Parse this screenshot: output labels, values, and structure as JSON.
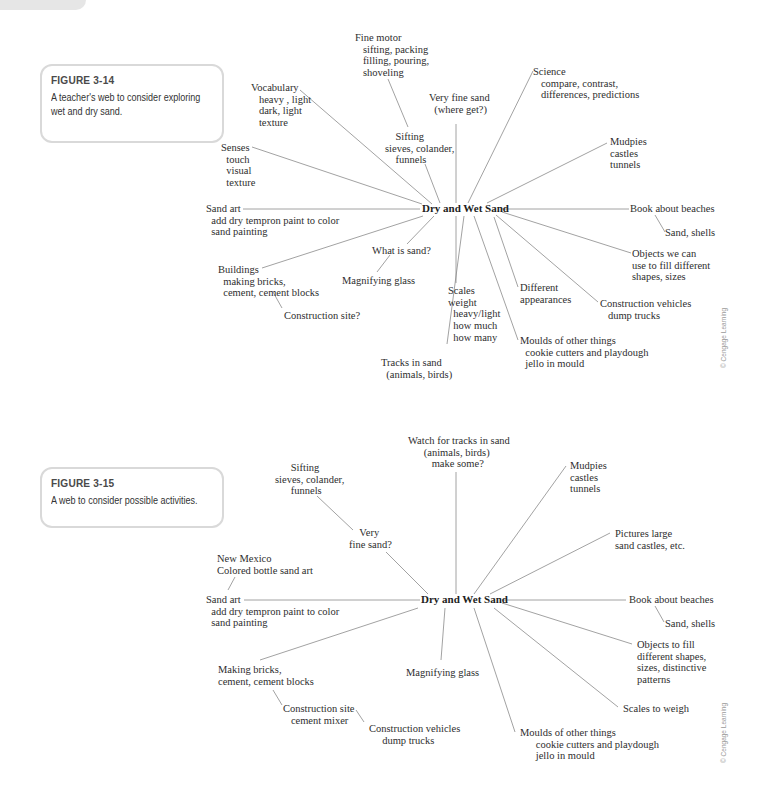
{
  "page": {
    "background": "#ffffff",
    "line_color": "#8a8a8a",
    "caption_border": "#d9d9d9"
  },
  "figures": [
    {
      "caption": {
        "title": "FIGURE 3-14",
        "lines": [
          "A teacher's web to consider exploring",
          "wet and dry sand."
        ]
      },
      "center": "Dry and Wet Sand",
      "nodes": {
        "fine_motor": "Fine motor\n   sifting, packing\n   filling, pouring,\n   shoveling",
        "vocabulary": "Vocabulary\n   heavy , light\n   dark, light\n   texture",
        "very_fine_sand": "Very fine sand\n  (where get?)",
        "science": "Science\n   compare, contrast,\n   differences, predictions",
        "sifting": "    Sifting\nsieves, colander,\n    funnels",
        "senses": "Senses\n  touch\n  visual\n  texture",
        "mudpies": "Mudpies\ncastles\ntunnels",
        "sand_art": "Sand art\n  add dry tempron paint to color\n  sand painting",
        "book": "Book about beaches",
        "sand_shells": "Sand, shells",
        "what_is_sand": "What is sand?",
        "objects": "Objects we can\nuse to fill different\nshapes, sizes",
        "buildings": "Buildings\n  making bricks,\n  cement, cement blocks",
        "magnifying": "Magnifying glass",
        "different": "Different\nappearances",
        "scales": "Scales\nweight\n  heavy/light\n  how much\n  how many",
        "construction_vehicles": "Construction vehicles\n   dump trucks",
        "construction_site": "Construction site?",
        "moulds": "Moulds of other things\n  cookie cutters and playdough\n  jello in mould",
        "tracks": "Tracks in sand\n  (animals, birds)"
      },
      "credit": "© Cengage Learning"
    },
    {
      "caption": {
        "title": "FIGURE 3-15",
        "lines": [
          "A web to consider possible activities."
        ]
      },
      "center": "Dry and Wet Sand",
      "nodes": {
        "watch_tracks": "Watch for tracks in sand\n      (animals, birds)\n         make some?",
        "sifting": "      Sifting\nsieves, colander,\n      funnels",
        "mudpies": "Mudpies\ncastles\ntunnels",
        "very_fine_sand": "    Very\nfine sand?",
        "pictures": "Pictures large\nsand castles, etc.",
        "new_mexico": "New Mexico\nColored bottle sand art",
        "sand_art": "Sand art\n  add dry tempron paint to color\n  sand painting",
        "book": "Book about beaches",
        "sand_shells": "Sand, shells",
        "objects": "Objects to fill\ndifferent shapes,\nsizes, distinctive\npatterns",
        "making_bricks": "Making bricks,\ncement, cement blocks",
        "magnifying": "Magnifying glass",
        "scales": "Scales to weigh",
        "construction_site": "Construction site\n   cement mixer",
        "construction_vehicles": "Construction vehicles\n     dump trucks",
        "moulds": "Moulds of other things\n      cookie cutters and playdough\n      jello in mould"
      },
      "credit": "© Cengage Learning"
    }
  ]
}
